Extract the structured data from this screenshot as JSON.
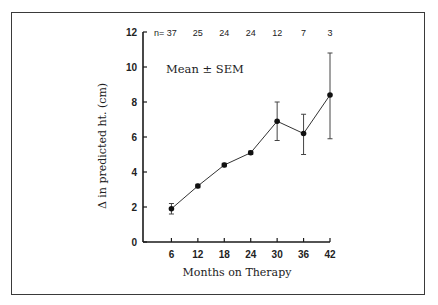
{
  "chart_data": {
    "type": "line",
    "title": "",
    "xlabel": "Months on Therapy",
    "ylabel": "Δ in predicted ht. (cm)",
    "annotation": "Mean ± SEM",
    "x": [
      6,
      12,
      18,
      24,
      30,
      36,
      42
    ],
    "series": [
      {
        "name": "Mean Δ predicted height",
        "values": [
          1.9,
          3.2,
          4.4,
          5.1,
          6.9,
          6.2,
          8.4
        ],
        "error_upper": [
          2.2,
          3.3,
          4.5,
          5.2,
          8.0,
          7.3,
          10.8
        ],
        "error_lower": [
          1.6,
          3.1,
          4.3,
          5.0,
          5.8,
          5.0,
          5.9
        ]
      }
    ],
    "n_label_prefix": "n=",
    "n_values": [
      "37",
      "25",
      "24",
      "24",
      "12",
      "7",
      "3"
    ],
    "xticks": [
      "6",
      "12",
      "18",
      "24",
      "30",
      "36",
      "42"
    ],
    "yticks": [
      "0",
      "2",
      "4",
      "6",
      "8",
      "10",
      "12"
    ],
    "xlim": [
      0,
      42
    ],
    "ylim": [
      0,
      12
    ],
    "grid": false,
    "legend": "none"
  }
}
